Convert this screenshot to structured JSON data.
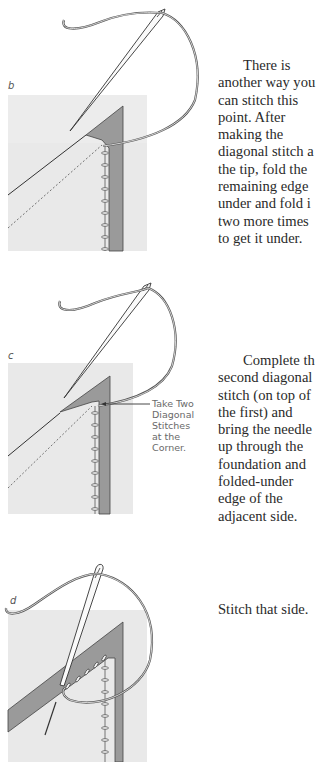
{
  "steps": [
    {
      "letter": "b",
      "lines": [
        "There is",
        "another way you",
        "can stitch this",
        "point. After",
        "making the",
        "diagonal stitch a",
        "the tip, fold the",
        "remaining edge",
        "under and fold i",
        "two more times",
        "to get it under."
      ]
    },
    {
      "letter": "c",
      "callout": "Take Two\nDiagonal\nStitches\nat the\nCorner.",
      "lines": [
        "Complete th",
        "second diagonal",
        "stitch (on top of",
        "the first) and",
        "bring the needle",
        "up through the",
        "foundation and",
        "folded-under",
        "edge of the",
        "adjacent side."
      ]
    },
    {
      "letter": "d",
      "lines": [
        "Stitch that side."
      ]
    }
  ],
  "colors": {
    "fabric": "#e9e9e9",
    "strip": "#9a9a9a",
    "outline": "#333333",
    "thread": "#555555"
  }
}
